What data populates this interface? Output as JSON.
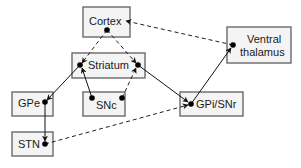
{
  "diagram": {
    "type": "basal-ganglia-circuit",
    "nodes": [
      {
        "id": "cortex",
        "label": "Cortex",
        "x": 83,
        "y": 7,
        "w": 47,
        "h": 30
      },
      {
        "id": "striatum",
        "label": "Striatum",
        "x": 72,
        "y": 53,
        "w": 73,
        "h": 25
      },
      {
        "id": "ventral-thalamus",
        "label_line1": "Ventral",
        "label_line2": "thalamus",
        "x": 227,
        "y": 27,
        "w": 64,
        "h": 36
      },
      {
        "id": "gpe",
        "label": "GPe",
        "x": 12,
        "y": 92,
        "w": 41,
        "h": 24
      },
      {
        "id": "snc",
        "label": "SNc",
        "x": 83,
        "y": 92,
        "w": 42,
        "h": 24
      },
      {
        "id": "gpi-snr",
        "label": "GPi/SNr",
        "x": 180,
        "y": 92,
        "w": 63,
        "h": 24
      },
      {
        "id": "stn",
        "label": "STN",
        "x": 12,
        "y": 132,
        "w": 41,
        "h": 24
      }
    ],
    "edges": [
      {
        "from": "cortex",
        "to": "striatum-left",
        "style": "dashed"
      },
      {
        "from": "cortex",
        "to": "striatum-right",
        "style": "dashed"
      },
      {
        "from": "striatum-left",
        "to": "gpe",
        "style": "solid"
      },
      {
        "from": "striatum-right",
        "to": "gpi-snr",
        "style": "solid"
      },
      {
        "from": "snc-left",
        "to": "striatum-left",
        "style": "solid"
      },
      {
        "from": "snc-right",
        "to": "striatum-right",
        "style": "dashed"
      },
      {
        "from": "gpe",
        "to": "stn",
        "style": "solid"
      },
      {
        "from": "stn",
        "to": "gpi-snr",
        "style": "dashed"
      },
      {
        "from": "gpi-snr",
        "to": "ventral-thalamus",
        "style": "solid"
      },
      {
        "from": "ventral-thalamus",
        "to": "cortex",
        "style": "dashed"
      }
    ],
    "legend": {
      "solid": "inhibitory/direct projection",
      "dashed": "excitatory/modulatory projection"
    }
  },
  "labels": {
    "cortex": "Cortex",
    "striatum": "Striatum",
    "ventral_line1": "Ventral",
    "ventral_line2": "thalamus",
    "gpe": "GPe",
    "snc": "SNc",
    "gpi_snr": "GPi/SNr",
    "stn": "STN"
  }
}
